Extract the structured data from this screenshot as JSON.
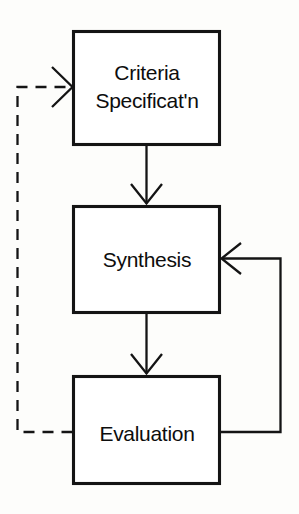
{
  "diagram": {
    "type": "flowchart",
    "background_color": "#fdfdfb",
    "line_color": "#141414",
    "nodes": [
      {
        "id": "criteria",
        "label_line1": "Criteria",
        "label_line2": "Specificat'n",
        "shape": "rectangle"
      },
      {
        "id": "synthesis",
        "label_line1": "Synthesis",
        "label_line2": "",
        "shape": "rectangle"
      },
      {
        "id": "evaluation",
        "label_line1": "Evaluation",
        "label_line2": "",
        "shape": "rectangle"
      }
    ],
    "edges": [
      {
        "id": "criteria-to-synthesis",
        "from": "criteria",
        "to": "synthesis",
        "style": "solid",
        "direction": "down",
        "label": ""
      },
      {
        "id": "synthesis-to-evaluation",
        "from": "synthesis",
        "to": "evaluation",
        "style": "solid",
        "direction": "down",
        "label": ""
      },
      {
        "id": "evaluation-to-synthesis-feedback",
        "from": "evaluation",
        "to": "synthesis",
        "style": "solid",
        "direction": "right-up-left",
        "label": ""
      },
      {
        "id": "evaluation-to-criteria-feedback",
        "from": "evaluation",
        "to": "criteria",
        "style": "dashed",
        "direction": "left-up-right",
        "label": ""
      }
    ]
  }
}
